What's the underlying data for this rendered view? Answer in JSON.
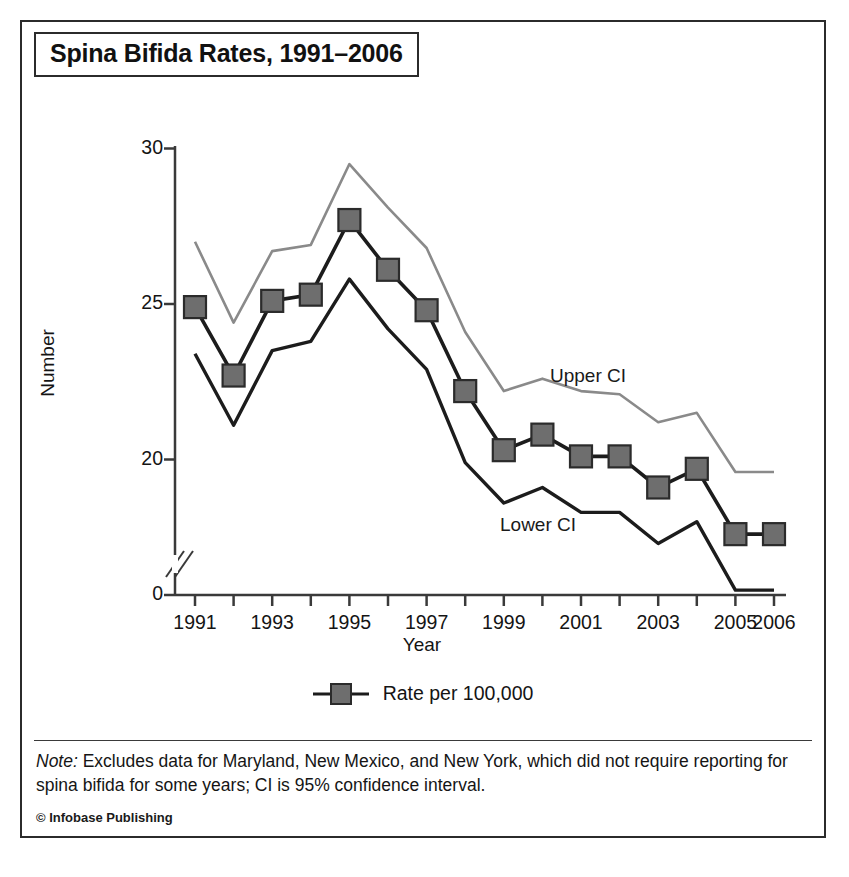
{
  "title": "Spina Bifida Rates, 1991–2006",
  "credit": "© Infobase Publishing",
  "note": {
    "lead": "Note:",
    "body": " Excludes data for Maryland, New Mexico, and New York, which did not require reporting for spina bifida for some years; CI is 95% confidence interval."
  },
  "legend": {
    "items": [
      {
        "label": "Rate per 100,000",
        "marker": "filled-square",
        "color": "#6e6e6e"
      }
    ]
  },
  "colors": {
    "rate_line": "#1c1c1c",
    "marker_fill": "#6e6e6e",
    "marker_stroke": "#2b2b2b",
    "upper_ci_line": "#8a8a8a",
    "lower_ci_line": "#1c1c1c",
    "axis": "#3a3a3a",
    "text": "#141414"
  },
  "chart_data": {
    "type": "line",
    "title": "Spina Bifida Rates, 1991–2006",
    "xlabel": "Year",
    "ylabel": "Number",
    "x": [
      1991,
      1992,
      1993,
      1994,
      1995,
      1996,
      1997,
      1998,
      1999,
      2000,
      2001,
      2002,
      2003,
      2004,
      2005,
      2006
    ],
    "xtick_labels": [
      "1991",
      "",
      "1993",
      "",
      "1995",
      "",
      "1997",
      "",
      "1999",
      "",
      "2001",
      "",
      "2003",
      "",
      "2005",
      "2006"
    ],
    "xtick_labels_shown": [
      "1991",
      "1993",
      "1995",
      "1997",
      "1999",
      "2001",
      "2003",
      "2005",
      "2006"
    ],
    "ytick_labels": [
      "0",
      "20",
      "25",
      "30"
    ],
    "yticks": [
      0,
      20,
      25,
      30
    ],
    "ylim": [
      0,
      30
    ],
    "axis_break": true,
    "axis_break_note": "y-axis broken between 0 and 20",
    "grid": false,
    "legend_position": "bottom-center",
    "series": [
      {
        "name": "Rate per 100,000",
        "marker": "square",
        "values": [
          24.9,
          22.7,
          25.1,
          25.3,
          27.7,
          26.1,
          24.8,
          22.2,
          20.3,
          20.8,
          20.1,
          20.1,
          19.1,
          19.7,
          17.6,
          17.6
        ]
      },
      {
        "name": "Upper CI",
        "marker": "none",
        "annotation": "Upper CI",
        "values": [
          27.0,
          24.4,
          26.7,
          26.9,
          29.5,
          28.1,
          26.8,
          24.1,
          22.2,
          22.6,
          22.2,
          22.1,
          21.2,
          21.5,
          19.6,
          19.6
        ]
      },
      {
        "name": "Lower CI",
        "marker": "none",
        "annotation": "Lower CI",
        "values": [
          23.4,
          21.1,
          23.5,
          23.8,
          25.8,
          24.2,
          22.9,
          19.9,
          18.6,
          19.1,
          18.3,
          18.3,
          17.3,
          18.0,
          15.8,
          15.8
        ]
      }
    ],
    "annotations": [
      {
        "text": "Upper CI",
        "near_x": 2000,
        "near_y": 23.5
      },
      {
        "text": "Lower CI",
        "near_x": 1999,
        "near_y": 17.0
      }
    ]
  }
}
